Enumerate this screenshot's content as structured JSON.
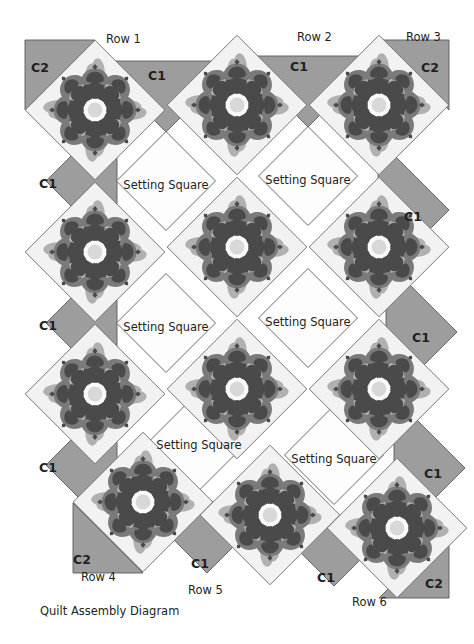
{
  "diagram": {
    "caption": "Quilt Assembly Diagram",
    "caption_pos": {
      "x": 40,
      "y": 604
    },
    "block_label": "Setting Square",
    "bg_color": "#ffffff",
    "line_color": "#58595b",
    "text_color": "#231f20"
  },
  "palette": {
    "background_white": "#fdfdfd",
    "triangle_gray": "#9d9d9d",
    "triangle_gray_light": "#b5b5b5",
    "block_bg": "#f2f2f2",
    "petal_light": "#b0b0b0",
    "petal_mid": "#7a7a7a",
    "petal_dark": "#4a4a4a",
    "center_light": "#d8d8d8",
    "center_white": "#fafafa",
    "outline": "#6d6e71"
  },
  "row_labels": [
    {
      "name": "row-1",
      "text": "Row 1",
      "x": 106,
      "y": 32
    },
    {
      "name": "row-2",
      "text": "Row 2",
      "x": 297,
      "y": 30
    },
    {
      "name": "row-3",
      "text": "Row 3",
      "x": 406,
      "y": 30
    },
    {
      "name": "row-4",
      "text": "Row 4",
      "x": 81,
      "y": 570
    },
    {
      "name": "row-5",
      "text": "Row 5",
      "x": 188,
      "y": 583
    },
    {
      "name": "row-6",
      "text": "Row 6",
      "x": 352,
      "y": 595
    }
  ],
  "corner_triangles": [
    {
      "name": "corner-c2-top-left",
      "label": "C2",
      "lx": 31,
      "ly": 60
    },
    {
      "name": "corner-c2-top-right",
      "label": "C2",
      "lx": 421,
      "ly": 60
    },
    {
      "name": "corner-c2-bottom-left",
      "label": "C2",
      "lx": 73,
      "ly": 552
    },
    {
      "name": "corner-c2-bottom-right",
      "label": "C2",
      "lx": 425,
      "ly": 576
    }
  ],
  "side_triangles": [
    {
      "name": "side-c1-top-1",
      "label": "C1",
      "lx": 148,
      "ly": 68
    },
    {
      "name": "side-c1-top-2",
      "label": "C1",
      "lx": 290,
      "ly": 59
    },
    {
      "name": "side-c1-left-1",
      "label": "C1",
      "lx": 39,
      "ly": 176
    },
    {
      "name": "side-c1-left-2",
      "label": "C1",
      "lx": 39,
      "ly": 318
    },
    {
      "name": "side-c1-left-3",
      "label": "C1",
      "lx": 39,
      "ly": 460
    },
    {
      "name": "side-c1-right-1",
      "label": "C1",
      "lx": 404,
      "ly": 209
    },
    {
      "name": "side-c1-right-2",
      "label": "C1",
      "lx": 412,
      "ly": 330
    },
    {
      "name": "side-c1-right-3",
      "label": "C1",
      "lx": 424,
      "ly": 466
    },
    {
      "name": "side-c1-bottom-1",
      "label": "C1",
      "lx": 191,
      "ly": 556
    },
    {
      "name": "side-c1-bottom-2",
      "label": "C1",
      "lx": 317,
      "ly": 570
    }
  ],
  "flower_blocks": [
    {
      "name": "flower-block-r1c1",
      "cx": 95,
      "cy": 110
    },
    {
      "name": "flower-block-r1c2",
      "cx": 237,
      "cy": 105
    },
    {
      "name": "flower-block-r1c3",
      "cx": 379,
      "cy": 105
    },
    {
      "name": "flower-block-r2c1",
      "cx": 95,
      "cy": 252
    },
    {
      "name": "flower-block-r2c2",
      "cx": 237,
      "cy": 247
    },
    {
      "name": "flower-block-r2c3",
      "cx": 379,
      "cy": 247
    },
    {
      "name": "flower-block-r3c1",
      "cx": 95,
      "cy": 394
    },
    {
      "name": "flower-block-r3c2",
      "cx": 237,
      "cy": 389
    },
    {
      "name": "flower-block-r3c3",
      "cx": 379,
      "cy": 389
    },
    {
      "name": "flower-block-r4c1",
      "cx": 143,
      "cy": 502
    },
    {
      "name": "flower-block-r4c2",
      "cx": 270,
      "cy": 515
    },
    {
      "name": "flower-block-r4c3",
      "cx": 397,
      "cy": 528
    }
  ],
  "setting_squares": [
    {
      "name": "setting-square-1",
      "cx": 166,
      "cy": 181,
      "tx": 166,
      "ty": 185
    },
    {
      "name": "setting-square-2",
      "cx": 308,
      "cy": 176,
      "tx": 308,
      "ty": 180
    },
    {
      "name": "setting-square-3",
      "cx": 166,
      "cy": 323,
      "tx": 166,
      "ty": 327
    },
    {
      "name": "setting-square-4",
      "cx": 308,
      "cy": 318,
      "tx": 308,
      "ty": 322
    },
    {
      "name": "setting-square-5",
      "cx": 199,
      "cy": 441,
      "tx": 199,
      "ty": 445
    },
    {
      "name": "setting-square-6",
      "cx": 334,
      "cy": 455,
      "tx": 334,
      "ty": 459
    }
  ]
}
